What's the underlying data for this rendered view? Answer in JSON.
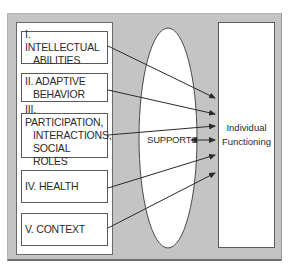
{
  "diagram": {
    "dimensions": [
      {
        "numeral": "I.",
        "line1": "I. INTELLECTUAL",
        "line2": "ABILITIES"
      },
      {
        "numeral": "II.",
        "line1": "II. ADAPTIVE",
        "line2": "BEHAVIOR"
      },
      {
        "numeral": "III.",
        "line1": "III. PARTICIPATION,",
        "line2": "INTERACTIONS,",
        "line3": "SOCIAL ROLES"
      },
      {
        "numeral": "IV.",
        "line1": "IV. HEALTH"
      },
      {
        "numeral": "V.",
        "line1": "V. CONTEXT"
      }
    ],
    "center": {
      "label": "SUPPORTS"
    },
    "outcome": {
      "line1": "Individual",
      "line2": "Functioning"
    },
    "colors": {
      "background": "#c4c4c4",
      "box_fill": "#ffffff",
      "stroke": "#2a2a2a"
    }
  }
}
